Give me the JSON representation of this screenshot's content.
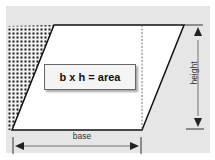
{
  "diagram": {
    "formula": "b x h = area",
    "labels": {
      "base": "base",
      "height": "height"
    },
    "colors": {
      "panel_background": "#e6e6e6",
      "shape_fill": "#ffffff",
      "stroke": "#111111",
      "pattern_dots": "#1a1a1a",
      "dimension_lines": "#555555"
    }
  }
}
